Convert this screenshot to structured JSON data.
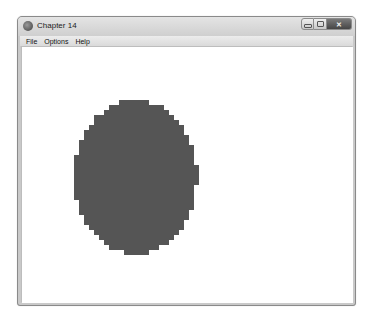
{
  "window": {
    "title": "Chapter 14",
    "icon": "app-globe-icon",
    "caption_buttons": {
      "minimize": "minimize-icon",
      "maximize": "maximize-icon",
      "close_label": "✕"
    }
  },
  "menubar": {
    "items": [
      {
        "label": "File"
      },
      {
        "label": "Options"
      },
      {
        "label": "Help"
      }
    ]
  },
  "canvas": {
    "shape": "filled-ellipse",
    "rendering": "pixelated",
    "fill_color": "#555555",
    "background_color": "#ffffff"
  }
}
